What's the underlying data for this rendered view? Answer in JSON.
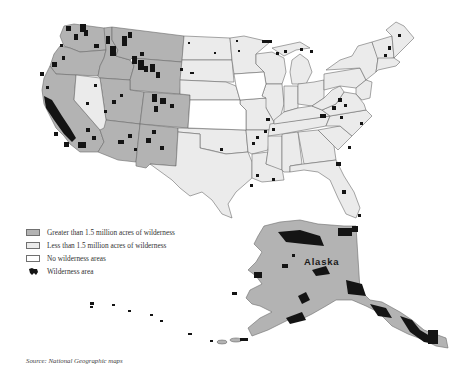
{
  "map": {
    "title": "Wilderness areas of the United States",
    "regions": {
      "alaska_label": "Alaska"
    },
    "categories": {
      "greater": [
        "Washington",
        "Oregon",
        "Idaho",
        "Montana",
        "Wyoming",
        "California",
        "Colorado",
        "Arizona",
        "New Mexico",
        "Utah",
        "Alaska"
      ],
      "less": [
        "Nevada",
        "North Dakota",
        "South Dakota",
        "Nebraska",
        "Minnesota",
        "Wisconsin",
        "Michigan",
        "Illinois",
        "Missouri",
        "Oklahoma",
        "Texas",
        "Arkansas",
        "Louisiana",
        "Mississippi",
        "Alabama",
        "Georgia",
        "Florida",
        "Tennessee",
        "Kentucky",
        "Ohio",
        "Indiana",
        "West Virginia",
        "Virginia",
        "North Carolina",
        "South Carolina",
        "Pennsylvania",
        "New York",
        "Vermont",
        "New Hampshire",
        "Maine",
        "Massachusetts",
        "New Jersey",
        "Hawaii"
      ],
      "none": [
        "Iowa",
        "Kansas"
      ]
    },
    "colors": {
      "greater": "#b3b3b3",
      "less": "#ebebeb",
      "none": "#ffffff",
      "wilderness": "#141414",
      "border": "#6b6b6b"
    }
  },
  "legend": {
    "items": [
      {
        "label": "Greater than 1.5 million acres of wilderness",
        "color": "#b3b3b3"
      },
      {
        "label": "Less than 1.5 million acres of wilderness",
        "color": "#ebebeb"
      },
      {
        "label": "No wilderness areas",
        "color": "#ffffff"
      },
      {
        "label": "Wilderness area",
        "symbol": "wilderness-blob"
      }
    ]
  },
  "source": "Source: National Geographic maps"
}
